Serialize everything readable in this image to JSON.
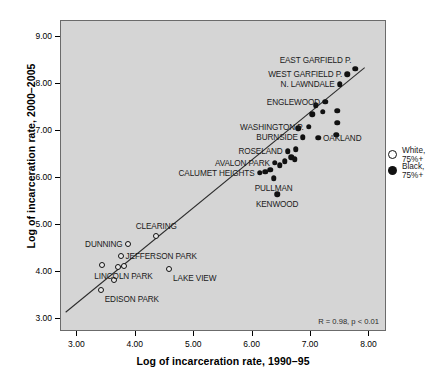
{
  "chart_data": {
    "type": "scatter",
    "title": "",
    "xlabel": "Log of incarceration rate, 1990–95",
    "ylabel": "Log of incarceration rate, 2000–2005",
    "xlim": [
      2.72,
      8.3
    ],
    "ylim": [
      2.72,
      9.35
    ],
    "xticks": [
      "3.00",
      "4.00",
      "5.00",
      "6.00",
      "7.00",
      "8.00"
    ],
    "yticks": [
      "3.00",
      "4.00",
      "5.00",
      "6.00",
      "7.00",
      "8.00",
      "9.00"
    ],
    "xtick_values": [
      3,
      4,
      5,
      6,
      7,
      8
    ],
    "ytick_values": [
      3,
      4,
      5,
      6,
      7,
      8,
      9
    ],
    "grid": false,
    "legend_position": "right",
    "annotation": "R = 0.98, p < 0.01",
    "plot_background": "#d5d5d5",
    "regression_line": {
      "x1": 2.8,
      "y1": 3.1,
      "x2": 7.95,
      "y2": 8.35
    },
    "series": [
      {
        "name": "White, 75%+",
        "marker": "open-circle",
        "color": "#ffffff",
        "edge_color": "#111111",
        "points": [
          {
            "label": "CLEARING",
            "x": 4.35,
            "y": 4.77,
            "label_pos": "above"
          },
          {
            "label": "DUNNING",
            "x": 3.86,
            "y": 4.6,
            "label_pos": "left"
          },
          {
            "label": "JEFFERSON PARK",
            "x": 3.74,
            "y": 4.34,
            "label_pos": "right"
          },
          {
            "label": "LAKE VIEW",
            "x": 4.57,
            "y": 4.06,
            "label_pos": "below-right"
          },
          {
            "label": "LINCOLN PARK",
            "x": 3.79,
            "y": 4.12,
            "label_pos": "below"
          },
          {
            "label": "EDISON PARK",
            "x": 3.4,
            "y": 3.62,
            "label_pos": "below-right"
          },
          {
            "label": "",
            "x": 3.42,
            "y": 4.14,
            "label_pos": ""
          },
          {
            "label": "",
            "x": 3.69,
            "y": 4.11,
            "label_pos": ""
          },
          {
            "label": "",
            "x": 3.63,
            "y": 3.82,
            "label_pos": ""
          }
        ]
      },
      {
        "name": "Black, 75%+",
        "marker": "filled-circle",
        "color": "#111111",
        "edge_color": "#111111",
        "points": [
          {
            "label": "EAST GARFIELD P.",
            "x": 7.76,
            "y": 8.33,
            "label_pos": "above-left"
          },
          {
            "label": "WEST GARFIELD P.",
            "x": 7.62,
            "y": 8.22,
            "label_pos": "left"
          },
          {
            "label": "N. LAWNDALE",
            "x": 7.49,
            "y": 8.0,
            "label_pos": "left"
          },
          {
            "label": "ENGLEWOOD",
            "x": 7.24,
            "y": 7.63,
            "label_pos": "left"
          },
          {
            "label": "WASHINGTON P.",
            "x": 6.96,
            "y": 7.1,
            "label_pos": "left"
          },
          {
            "label": "BURNSIDE",
            "x": 6.86,
            "y": 6.87,
            "label_pos": "left"
          },
          {
            "label": "OAKLAND",
            "x": 7.12,
            "y": 6.86,
            "label_pos": "right"
          },
          {
            "label": "ROSELAND",
            "x": 6.6,
            "y": 6.57,
            "label_pos": "left"
          },
          {
            "label": "AVALON PARK",
            "x": 6.38,
            "y": 6.33,
            "label_pos": "left"
          },
          {
            "label": "CALUMET HEIGHTS",
            "x": 6.12,
            "y": 6.12,
            "label_pos": "left"
          },
          {
            "label": "PULLMAN",
            "x": 6.36,
            "y": 6.0,
            "label_pos": "below"
          },
          {
            "label": "KENWOOD",
            "x": 6.42,
            "y": 5.66,
            "label_pos": "below"
          },
          {
            "label": "",
            "x": 7.08,
            "y": 7.55,
            "label_pos": ""
          },
          {
            "label": "",
            "x": 7.2,
            "y": 7.42,
            "label_pos": ""
          },
          {
            "label": "",
            "x": 7.02,
            "y": 7.36,
            "label_pos": ""
          },
          {
            "label": "",
            "x": 7.45,
            "y": 7.44,
            "label_pos": ""
          },
          {
            "label": "",
            "x": 7.45,
            "y": 7.18,
            "label_pos": ""
          },
          {
            "label": "",
            "x": 7.43,
            "y": 6.93,
            "label_pos": ""
          },
          {
            "label": "",
            "x": 6.78,
            "y": 7.06,
            "label_pos": ""
          },
          {
            "label": "",
            "x": 6.74,
            "y": 6.62,
            "label_pos": ""
          },
          {
            "label": "",
            "x": 6.66,
            "y": 6.45,
            "label_pos": ""
          },
          {
            "label": "",
            "x": 6.72,
            "y": 6.4,
            "label_pos": ""
          },
          {
            "label": "",
            "x": 6.55,
            "y": 6.36,
            "label_pos": ""
          },
          {
            "label": "",
            "x": 6.46,
            "y": 6.28,
            "label_pos": ""
          },
          {
            "label": "",
            "x": 6.3,
            "y": 6.18,
            "label_pos": ""
          },
          {
            "label": "",
            "x": 6.22,
            "y": 6.14,
            "label_pos": ""
          }
        ]
      }
    ]
  },
  "legend": {
    "items": [
      {
        "label": "White, 75%+",
        "marker": "open-circle"
      },
      {
        "label": "Black, 75%+",
        "marker": "filled-circle"
      }
    ]
  },
  "axes": {
    "x_title": "Log of incarceration rate, 1990–95",
    "y_title": "Log of incarceration rate, 2000–2005"
  },
  "annotation": {
    "correlation": "R = 0.98, p < 0.01"
  }
}
